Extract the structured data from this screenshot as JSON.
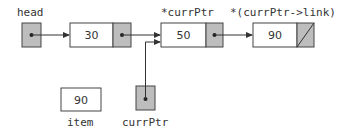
{
  "diagram": {
    "type": "linked-list-pointer-diagram",
    "colors": {
      "pointer_fill": "#bdbdbd",
      "border": "#444444",
      "line": "#333333",
      "background": "#ffffff"
    },
    "labels": {
      "head": "head",
      "curr_node": "*currPtr",
      "next_node": "*(currPtr->link)",
      "item": "item",
      "curr_ptr": "currPtr"
    },
    "nodes": [
      {
        "id": "node-1",
        "value": "30",
        "link": "node-2"
      },
      {
        "id": "node-2",
        "value": "50",
        "link": "node-3"
      },
      {
        "id": "node-3",
        "value": "90",
        "link": "null"
      }
    ],
    "variables": {
      "head": {
        "points_to": "node-1"
      },
      "item": {
        "value": "90"
      },
      "currPtr": {
        "points_to": "node-2"
      }
    }
  }
}
